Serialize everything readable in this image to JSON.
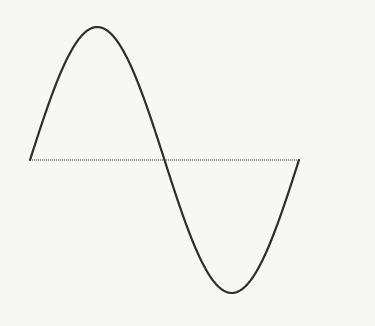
{
  "diagram": {
    "title": "Sine wave (one full period)",
    "type": "sine-wave",
    "colors": {
      "background": "#f7f7f6",
      "curve": "#2e2e2e",
      "axis": "#9a9a9a"
    },
    "axis": {
      "x_start": 30,
      "x_end": 299,
      "y": 160
    },
    "wave": {
      "x_start": 30,
      "x_end": 299,
      "baseline_y": 160,
      "amplitude_px": 133,
      "periods": 1,
      "key_points": [
        {
          "name": "start",
          "x": 30,
          "y": 160
        },
        {
          "name": "peak",
          "x": 97,
          "y": 27
        },
        {
          "name": "zero-crossing",
          "x": 164,
          "y": 160
        },
        {
          "name": "trough",
          "x": 232,
          "y": 293
        },
        {
          "name": "end",
          "x": 299,
          "y": 160
        }
      ]
    }
  }
}
